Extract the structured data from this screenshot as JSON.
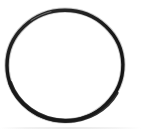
{
  "canvas": {
    "width": 141,
    "height": 129,
    "background_color": "#ffffff",
    "title": "Circle outline"
  },
  "figure": {
    "name": "ring",
    "description": "Hand-drawn black ring outline on white background",
    "shape_type": "ellipse-outline",
    "stroke_color": "#1a1a1a",
    "fill_color": "none",
    "center_x": 65,
    "center_y": 65.5,
    "radius_x": 57,
    "radius_y": 55,
    "stroke_width": 3.4,
    "bounds": {
      "left": 7,
      "top": 10,
      "right": 123,
      "bottom": 121
    }
  },
  "artifact": {
    "name": "bottom-scan-band",
    "color": "#e4e4e4"
  }
}
